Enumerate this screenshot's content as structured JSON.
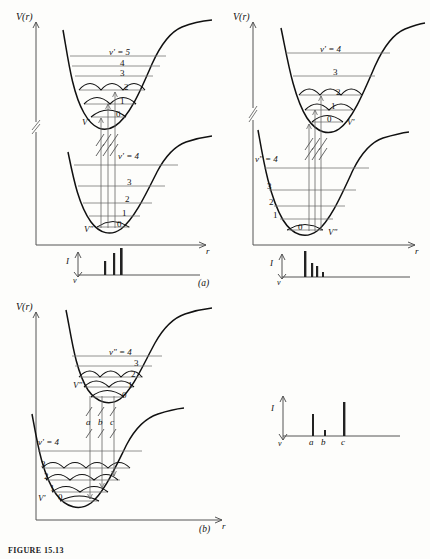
{
  "figure": {
    "caption": "FIGURE 15.13",
    "panel_a_label": "(a)",
    "panel_b_label": "(b)"
  },
  "axes": {
    "energy_label": "V(r)",
    "distance_label": "r",
    "intensity_label": "I",
    "frequency_label": "ν"
  },
  "panels": [
    {
      "id": "a-left",
      "upper_curve_label": "V'",
      "lower_curve_label": "V\"",
      "upper_levels": {
        "top_label": "v' = 5",
        "labels": [
          "5",
          "4",
          "3",
          "2",
          "1",
          "0"
        ]
      },
      "lower_levels": {
        "top_label": "v' = 4",
        "labels": [
          "4",
          "3",
          "2",
          "1",
          "0"
        ]
      },
      "spectrum": {
        "bars": [
          {
            "label": "",
            "height": 0.5
          },
          {
            "label": "",
            "height": 0.8
          },
          {
            "label": "",
            "height": 1.0
          }
        ]
      }
    },
    {
      "id": "a-right",
      "upper_curve_label": "V'",
      "lower_curve_label": "V\"",
      "upper_levels": {
        "top_label": "v' = 4",
        "labels": [
          "4",
          "3",
          "2",
          "1",
          "0"
        ]
      },
      "lower_levels": {
        "top_label": "v\" = 4",
        "labels": [
          "4",
          "3",
          "2",
          "1",
          "0"
        ]
      },
      "spectrum": {
        "bars": [
          {
            "label": "",
            "height": 1.0
          },
          {
            "label": "",
            "height": 0.55
          },
          {
            "label": "",
            "height": 0.4
          },
          {
            "label": "",
            "height": 0.18
          }
        ]
      }
    },
    {
      "id": "b",
      "upper_curve_label": "V\"",
      "lower_curve_label": "V'",
      "upper_levels": {
        "top_label": "v\" = 4",
        "labels": [
          "4",
          "3",
          "2",
          "1",
          "0"
        ]
      },
      "lower_levels": {
        "top_label": "v' = 4",
        "labels": [
          "4",
          "3",
          "2",
          "1",
          "0"
        ]
      },
      "transitions": [
        "a",
        "b",
        "c"
      ],
      "spectrum": {
        "bars": [
          {
            "label": "a",
            "height": 0.45
          },
          {
            "label": "b",
            "height": 0.12
          },
          {
            "label": "c",
            "height": 1.0
          }
        ]
      }
    }
  ],
  "colors": {
    "curve": "#111111",
    "level": "#6a6a6a",
    "transition": "#555555",
    "bar": "#222222",
    "axis": "#444444"
  }
}
